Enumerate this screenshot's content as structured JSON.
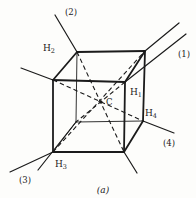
{
  "figure": {
    "caption": "(a)",
    "center_label": "C",
    "line_color": "#1b1b1b",
    "background_color": "#fdfdfb",
    "vertices": {
      "FTL": [
        53,
        80
      ],
      "FTR": [
        125,
        82
      ],
      "FBR": [
        124,
        152
      ],
      "FBL": [
        53,
        152
      ],
      "BTL": [
        77,
        52
      ],
      "BTR": [
        145,
        51
      ],
      "BBR": [
        143,
        121
      ],
      "BBL": [
        76,
        122
      ]
    },
    "visible_edges": [
      [
        "FTL",
        "FTR"
      ],
      [
        "FTR",
        "FBR"
      ],
      [
        "FBR",
        "FBL"
      ],
      [
        "FBL",
        "FTL"
      ],
      [
        "BTL",
        "BTR"
      ],
      [
        "BTR",
        "BBR"
      ],
      [
        "FTL",
        "BTL"
      ],
      [
        "FTR",
        "BTR"
      ],
      [
        "FBR",
        "BBR"
      ]
    ],
    "hidden_edges": [
      [
        "BBL",
        "BTL"
      ],
      [
        "BBL",
        "BBR"
      ],
      [
        "BBL",
        "FBL"
      ]
    ],
    "body_diagonals": [
      [
        "BTL",
        "FBR"
      ],
      [
        "FTR",
        "BBL"
      ],
      [
        "FBL",
        "BTR"
      ],
      [
        "FTL",
        "BBR"
      ]
    ],
    "axis_lines": [
      {
        "axis": "1",
        "from": [
          186,
          34
        ],
        "to": [
          125,
          82
        ]
      },
      {
        "axis": "1",
        "from": [
          76,
          122
        ],
        "to": [
          38,
          170
        ]
      },
      {
        "axis": "2",
        "from": [
          55,
          15
        ],
        "to": [
          77,
          52
        ]
      },
      {
        "axis": "2",
        "from": [
          124,
          152
        ],
        "to": [
          137,
          173
        ]
      },
      {
        "axis": "3",
        "from": [
          179,
          23
        ],
        "to": [
          145,
          51
        ]
      },
      {
        "axis": "3",
        "from": [
          53,
          152
        ],
        "to": [
          10,
          172
        ]
      },
      {
        "axis": "4",
        "from": [
          21,
          68
        ],
        "to": [
          53,
          80
        ]
      },
      {
        "axis": "4",
        "from": [
          143,
          121
        ],
        "to": [
          174,
          133
        ]
      }
    ],
    "center": {
      "x": 101,
      "y": 102
    },
    "atom_labels": [
      {
        "text": "H",
        "sub": "2"
      },
      {
        "text": "H",
        "sub": "1"
      },
      {
        "text": "H",
        "sub": "3"
      },
      {
        "text": "H",
        "sub": "4"
      }
    ],
    "axis_labels": [
      {
        "text": "(1)"
      },
      {
        "text": "(2)"
      },
      {
        "text": "(3)"
      },
      {
        "text": "(4)"
      }
    ]
  }
}
